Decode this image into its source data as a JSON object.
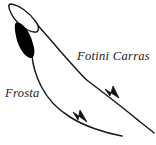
{
  "figure": {
    "name": "ocean-current-schematic",
    "width": 156,
    "height": 145,
    "background_color": "#ffffff",
    "stroke_color": "#1a1a1a",
    "fill_color": "#000000"
  },
  "labels": {
    "fotini_carras": "Fotini Carras",
    "frosta": "Frosta"
  },
  "shapes": {
    "island_outline": {
      "name": "outlined-lens-shape",
      "fill": "#ffffff",
      "stroke": "#1a1a1a"
    },
    "island_filled": {
      "name": "filled-lens-shape",
      "fill": "#000000",
      "stroke": "#000000"
    }
  },
  "tracks": [
    {
      "name": "fotini-carras-track",
      "label": "Fotini Carras",
      "arrowhead": "filled-triangle",
      "direction": "down-right"
    },
    {
      "name": "frosta-track",
      "label": "Frosta",
      "arrowhead": "filled-triangle",
      "direction": "down-right"
    }
  ]
}
